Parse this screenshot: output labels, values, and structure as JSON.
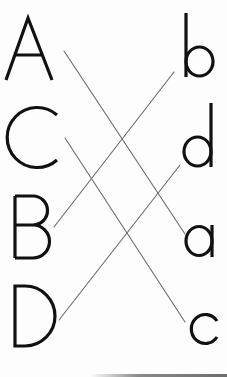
{
  "title": "Match uppercase letters to lowercase letters",
  "colors": {
    "letter": "#111111",
    "line": "#6a6a6a",
    "background": "#fdfdfd"
  },
  "left_column": [
    {
      "label": "A",
      "bbox": [
        5,
        17,
        53,
        80
      ]
    },
    {
      "label": "C",
      "bbox": [
        8,
        106,
        58,
        168
      ]
    },
    {
      "label": "B",
      "bbox": [
        14,
        195,
        47,
        259
      ]
    },
    {
      "label": "D",
      "bbox": [
        14,
        285,
        55,
        347
      ]
    }
  ],
  "right_column": [
    {
      "label": "b",
      "bbox": [
        185,
        13,
        214,
        77
      ]
    },
    {
      "label": "d",
      "bbox": [
        183,
        103,
        212,
        167
      ]
    },
    {
      "label": "a",
      "bbox": [
        185,
        225,
        213,
        257
      ]
    },
    {
      "label": "c",
      "bbox": [
        192,
        313,
        218,
        344
      ]
    }
  ],
  "matches": [
    {
      "from": "A",
      "to": "a",
      "x1": 64,
      "y1": 51,
      "x2": 185,
      "y2": 234
    },
    {
      "from": "C",
      "to": "c",
      "x1": 65,
      "y1": 138,
      "x2": 185,
      "y2": 322
    },
    {
      "from": "B",
      "to": "b",
      "x1": 54,
      "y1": 227,
      "x2": 174,
      "y2": 72
    },
    {
      "from": "D",
      "to": "d",
      "x1": 59,
      "y1": 320,
      "x2": 180,
      "y2": 165
    }
  ]
}
